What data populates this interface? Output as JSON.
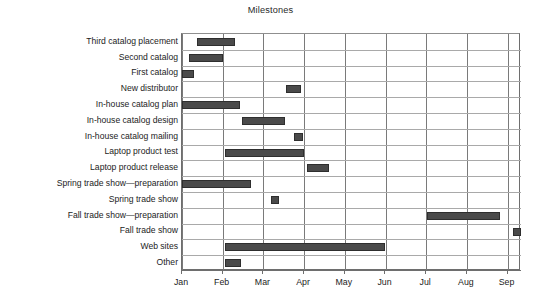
{
  "chart_data": {
    "type": "bar",
    "chart_subtype": "gantt",
    "title": "Milestones",
    "xlabel": "",
    "ylabel": "",
    "grid": true,
    "legend": false,
    "legend_position": "none",
    "bar_color": "#4a4a4a",
    "axis_color": "#6e6e6e",
    "gridline_color": "#a9a9a9",
    "x_axis": {
      "type": "month",
      "tick_labels": [
        "Jan",
        "Feb",
        "Mar",
        "Apr",
        "May",
        "Jun",
        "Jul",
        "Aug",
        "Sep"
      ],
      "tick_values": [
        1,
        2,
        3,
        4,
        5,
        6,
        7,
        8,
        9
      ],
      "xlim": [
        1.0,
        9.33
      ]
    },
    "categories": [
      "Third catalog placement",
      "Second catalog",
      "First catalog",
      "New distributor",
      "In-house catalog plan",
      "In-house catalog design",
      "In-house catalog mailing",
      "Laptop product test",
      "Laptop product release",
      "Spring trade show—preparation",
      "Spring trade show",
      "Fall trade show—preparation",
      "Fall trade show",
      "Web sites",
      "Other"
    ],
    "tasks": [
      {
        "name": "Third catalog placement",
        "start_month": 1.38,
        "end_month": 2.3
      },
      {
        "name": "Second catalog",
        "start_month": 1.16,
        "end_month": 2.02
      },
      {
        "name": "First catalog",
        "start_month": 1.0,
        "end_month": 1.3
      },
      {
        "name": "New distributor",
        "start_month": 3.56,
        "end_month": 3.92
      },
      {
        "name": "In-house catalog plan",
        "start_month": 1.0,
        "end_month": 2.42
      },
      {
        "name": "In-house catalog design",
        "start_month": 2.48,
        "end_month": 3.52
      },
      {
        "name": "In-house catalog mailing",
        "start_month": 3.74,
        "end_month": 3.98
      },
      {
        "name": "Laptop product test",
        "start_month": 2.06,
        "end_month": 4.0
      },
      {
        "name": "Laptop product release",
        "start_month": 4.08,
        "end_month": 4.6
      },
      {
        "name": "Spring trade show—preparation",
        "start_month": 1.0,
        "end_month": 2.7
      },
      {
        "name": "Spring trade show",
        "start_month": 3.18,
        "end_month": 3.38
      },
      {
        "name": "Fall trade show—preparation",
        "start_month": 7.02,
        "end_month": 8.82
      },
      {
        "name": "Fall trade show",
        "start_month": 9.14,
        "end_month": 9.33
      },
      {
        "name": "Web sites",
        "start_month": 2.06,
        "end_month": 5.98
      },
      {
        "name": "Other",
        "start_month": 2.06,
        "end_month": 2.46
      }
    ]
  }
}
